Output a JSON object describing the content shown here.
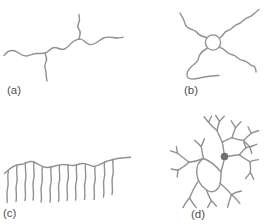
{
  "figure": {
    "background_color": "#ffffff",
    "line_color": "#8f9194",
    "label_color": "#4f5052",
    "node_fill_color": "#6e7073",
    "panels": [
      {
        "label": "(a)",
        "icon": "branched-polymer-chain-icon"
      },
      {
        "label": "(b)",
        "icon": "star-polymer-icon"
      },
      {
        "label": "(c)",
        "icon": "comb-polymer-icon"
      },
      {
        "label": "(d)",
        "icon": "hyperbranched-polymer-icon"
      }
    ]
  }
}
